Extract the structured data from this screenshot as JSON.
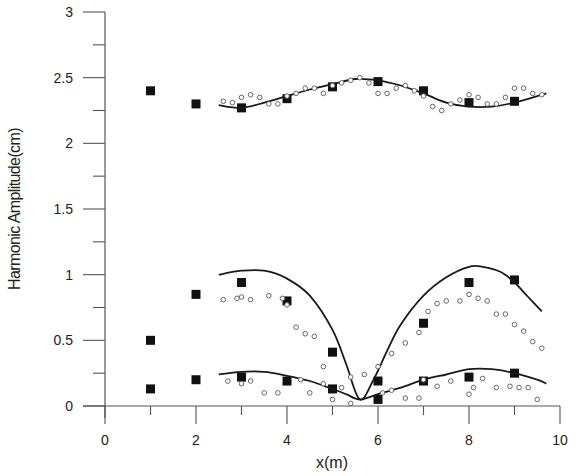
{
  "chart_data": {
    "type": "scatter",
    "title": "",
    "xlabel": "x(m)",
    "ylabel": "Harmonic Amplitude(cm)",
    "xlim": [
      0,
      10
    ],
    "ylim": [
      0,
      3
    ],
    "grid": false,
    "legend": null,
    "x_ticks": [
      "0",
      "2",
      "4",
      "6",
      "8",
      "10"
    ],
    "y_ticks": [
      "0",
      "0.5",
      "1",
      "1.5",
      "2",
      "2.5",
      "3"
    ],
    "series": [
      {
        "name": "upper-squares",
        "style": "filled-square",
        "x": [
          1,
          2,
          3,
          4,
          5,
          6,
          7,
          8,
          9
        ],
        "y": [
          2.4,
          2.3,
          2.27,
          2.34,
          2.43,
          2.47,
          2.4,
          2.31,
          2.32
        ]
      },
      {
        "name": "upper-line",
        "style": "solid-line",
        "x": [
          2.5,
          3.0,
          3.5,
          4.0,
          4.5,
          5.0,
          5.5,
          6.0,
          6.5,
          7.0,
          7.5,
          8.0,
          8.5,
          9.0,
          9.5,
          9.7
        ],
        "y": [
          2.29,
          2.27,
          2.31,
          2.36,
          2.41,
          2.45,
          2.49,
          2.48,
          2.44,
          2.38,
          2.31,
          2.28,
          2.28,
          2.31,
          2.36,
          2.38
        ]
      },
      {
        "name": "upper-circles",
        "style": "open-circle",
        "x": [
          2.6,
          2.8,
          3.0,
          3.2,
          3.4,
          3.6,
          3.8,
          4.0,
          4.2,
          4.4,
          4.6,
          4.8,
          5.0,
          5.2,
          5.4,
          5.6,
          5.8,
          6.0,
          6.2,
          6.4,
          6.6,
          6.8,
          7.0,
          7.2,
          7.4,
          7.6,
          7.8,
          8.0,
          8.2,
          8.4,
          8.6,
          8.8,
          9.0,
          9.2,
          9.4,
          9.6
        ],
        "y": [
          2.32,
          2.31,
          2.35,
          2.37,
          2.35,
          2.3,
          2.3,
          2.36,
          2.38,
          2.42,
          2.42,
          2.38,
          2.44,
          2.46,
          2.48,
          2.5,
          2.46,
          2.38,
          2.38,
          2.42,
          2.44,
          2.4,
          2.36,
          2.28,
          2.25,
          2.3,
          2.33,
          2.37,
          2.35,
          2.3,
          2.3,
          2.35,
          2.42,
          2.42,
          2.38,
          2.37
        ]
      },
      {
        "name": "middle-squares",
        "style": "filled-square",
        "x": [
          1,
          2,
          3,
          4,
          5,
          6,
          7,
          8,
          9
        ],
        "y": [
          0.5,
          0.85,
          0.94,
          0.8,
          0.41,
          0.19,
          0.63,
          0.94,
          0.96
        ]
      },
      {
        "name": "middle-line",
        "style": "solid-line",
        "x": [
          2.5,
          3.0,
          3.5,
          4.0,
          4.5,
          5.0,
          5.3,
          5.6,
          5.9,
          6.2,
          6.5,
          7.0,
          7.5,
          8.0,
          8.3,
          8.7,
          9.0,
          9.3,
          9.6
        ],
        "y": [
          1.0,
          1.03,
          1.03,
          0.97,
          0.84,
          0.58,
          0.32,
          0.05,
          0.2,
          0.42,
          0.62,
          0.84,
          0.98,
          1.06,
          1.06,
          1.02,
          0.94,
          0.83,
          0.72
        ]
      },
      {
        "name": "middle-circles",
        "style": "open-circle",
        "x": [
          2.6,
          2.9,
          3.0,
          3.2,
          3.6,
          3.9,
          4.0,
          4.2,
          4.4,
          4.6,
          4.8,
          5.4,
          5.7,
          6.0,
          6.3,
          6.6,
          6.9,
          7.1,
          7.3,
          7.5,
          7.8,
          8.0,
          8.2,
          8.4,
          8.6,
          8.8,
          9.0,
          9.2,
          9.4,
          9.6
        ],
        "y": [
          0.81,
          0.82,
          0.83,
          0.81,
          0.84,
          0.82,
          0.77,
          0.6,
          0.55,
          0.53,
          0.3,
          0.22,
          0.24,
          0.3,
          0.4,
          0.48,
          0.56,
          0.72,
          0.78,
          0.8,
          0.8,
          0.85,
          0.82,
          0.8,
          0.7,
          0.7,
          0.62,
          0.57,
          0.49,
          0.44
        ]
      },
      {
        "name": "bottom-squares",
        "style": "filled-square",
        "x": [
          1,
          2,
          3,
          4,
          5,
          6,
          7,
          8,
          9
        ],
        "y": [
          0.13,
          0.2,
          0.22,
          0.19,
          0.13,
          0.05,
          0.19,
          0.22,
          0.25
        ]
      },
      {
        "name": "bottom-line",
        "style": "solid-line",
        "x": [
          2.5,
          3.0,
          3.5,
          4.0,
          4.5,
          5.0,
          5.3,
          5.6,
          6.0,
          6.5,
          7.0,
          7.5,
          8.0,
          8.5,
          9.0,
          9.5,
          9.7
        ],
        "y": [
          0.24,
          0.26,
          0.26,
          0.23,
          0.19,
          0.13,
          0.09,
          0.05,
          0.09,
          0.14,
          0.2,
          0.24,
          0.28,
          0.28,
          0.25,
          0.2,
          0.17
        ]
      },
      {
        "name": "bottom-circles",
        "style": "open-circle",
        "x": [
          2.7,
          3.0,
          3.2,
          3.5,
          3.8,
          4.3,
          4.5,
          4.8,
          5.0,
          5.2,
          5.4,
          6.1,
          6.3,
          6.6,
          6.9,
          7.0,
          7.3,
          7.6,
          8.0,
          8.1,
          8.3,
          8.6,
          8.9,
          9.1,
          9.3,
          9.5
        ],
        "y": [
          0.19,
          0.17,
          0.19,
          0.1,
          0.1,
          0.2,
          0.1,
          0.17,
          0.05,
          0.14,
          0.02,
          0.1,
          0.12,
          0.06,
          0.06,
          0.2,
          0.15,
          0.19,
          0.09,
          0.14,
          0.21,
          0.14,
          0.15,
          0.14,
          0.14,
          0.05
        ]
      }
    ]
  }
}
